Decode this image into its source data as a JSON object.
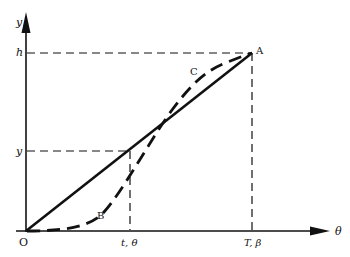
{
  "diagram": {
    "axes": {
      "x_label": "θ",
      "y_label": "y"
    },
    "origin_label": "O",
    "y_ticks": {
      "h": "h",
      "y": "y"
    },
    "x_ticks": {
      "t": "t, θ",
      "T": "T, β"
    },
    "points": {
      "A": "A",
      "B": "B",
      "C": "C"
    },
    "curves": [
      {
        "name": "straight-line-OA",
        "style": "solid",
        "from": "O",
        "to": "A"
      },
      {
        "name": "dashed-curve-OBCA",
        "style": "dashed",
        "passes": [
          "O",
          "B",
          "C",
          "A"
        ]
      }
    ],
    "colors": {
      "ink": "#111111",
      "background": "#ffffff"
    }
  }
}
